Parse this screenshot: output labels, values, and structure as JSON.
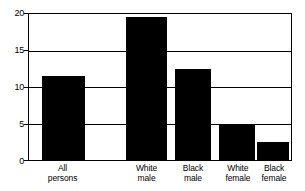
{
  "chart_data": {
    "type": "bar",
    "title": "",
    "subtitle": "",
    "xlabel": "",
    "ylabel": "",
    "categories": [
      "All persons",
      "White male",
      "Black male",
      "White female",
      "Black female"
    ],
    "category_lines": [
      [
        "All",
        "persons"
      ],
      [
        "White",
        "male"
      ],
      [
        "Black",
        "male"
      ],
      [
        "White",
        "female"
      ],
      [
        "Black",
        "female"
      ]
    ],
    "values": [
      11.5,
      19.6,
      12.5,
      5.0,
      2.4
    ],
    "ylim": [
      0,
      20
    ],
    "yticks": [
      0,
      5,
      10,
      15,
      20
    ],
    "ytick_labels": [
      "0",
      "5",
      "10",
      "15",
      "20"
    ],
    "grid": true,
    "grid_axis": "y",
    "legend": false,
    "legend_position": "none",
    "bar_color": "#000000",
    "frame_color": "#000000",
    "background_color": "#ffffff",
    "bar_geometry": [
      {
        "left_pct": 4.9,
        "width_pct": 16.3
      },
      {
        "left_pct": 37.1,
        "width_pct": 15.5
      },
      {
        "left_pct": 55.7,
        "width_pct": 13.6
      },
      {
        "left_pct": 72.7,
        "width_pct": 13.6
      },
      {
        "left_pct": 87.1,
        "width_pct": 12.1
      }
    ],
    "label_geometry": [
      {
        "center_pct": 13.1
      },
      {
        "center_pct": 44.9
      },
      {
        "center_pct": 62.5
      },
      {
        "center_pct": 79.5
      },
      {
        "center_pct": 93.2
      }
    ]
  }
}
